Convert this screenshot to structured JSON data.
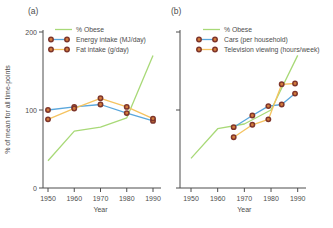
{
  "chart_data": [
    {
      "type": "line",
      "panel_label": "(a)",
      "xlabel": "Year",
      "ylabel": "% of mean for all time-points",
      "xlim": [
        1948,
        1993
      ],
      "ylim": [
        0,
        200
      ],
      "x_ticks": [
        1950,
        1960,
        1970,
        1980,
        1990
      ],
      "y_ticks": [
        0,
        100,
        200
      ],
      "show_y_tick_labels": true,
      "grid": false,
      "legend_position": "top-inside",
      "marker_style": {
        "fill": "#d47c3c",
        "stroke": "#7e352b"
      },
      "series": [
        {
          "name": "% Obese",
          "color": "#a8d977",
          "markers": false,
          "x": [
            1950,
            1960,
            1970,
            1980,
            1990
          ],
          "values": [
            35,
            73,
            78,
            90,
            170
          ]
        },
        {
          "name": "Energy intake (MJ/day)",
          "color": "#5aa7dc",
          "markers": true,
          "x": [
            1950,
            1960,
            1970,
            1980,
            1990
          ],
          "values": [
            100,
            104,
            107,
            96,
            86
          ]
        },
        {
          "name": "Fat intake (g/day)",
          "color": "#f5c360",
          "markers": true,
          "x": [
            1950,
            1960,
            1970,
            1980,
            1990
          ],
          "values": [
            88,
            102,
            115,
            104,
            89
          ]
        }
      ]
    },
    {
      "type": "line",
      "panel_label": "(b)",
      "xlabel": "Year",
      "ylabel": "",
      "xlim": [
        1948,
        1993
      ],
      "ylim": [
        0,
        200
      ],
      "x_ticks": [
        1950,
        1960,
        1970,
        1980,
        1990
      ],
      "y_ticks": [
        0,
        100,
        200
      ],
      "show_y_tick_labels": false,
      "grid": false,
      "legend_position": "top-inside",
      "marker_style": {
        "fill": "#d47c3c",
        "stroke": "#7e352b"
      },
      "series": [
        {
          "name": "% Obese",
          "color": "#a8d977",
          "markers": false,
          "x": [
            1950,
            1960,
            1970,
            1980,
            1990
          ],
          "values": [
            38,
            76,
            82,
            100,
            170
          ]
        },
        {
          "name": "Cars (per household)",
          "color": "#5aa7dc",
          "markers": true,
          "x": [
            1966,
            1973,
            1979,
            1984,
            1989
          ],
          "values": [
            78,
            93,
            105,
            107,
            121
          ]
        },
        {
          "name": "Television viewing (hours/week)",
          "color": "#f5c360",
          "markers": true,
          "x": [
            1966,
            1973,
            1979,
            1984,
            1989
          ],
          "values": [
            65,
            81,
            88,
            133,
            134
          ]
        }
      ]
    }
  ],
  "style": {
    "axis_color": "#4d4d4d",
    "text_color": "#4d4d4d",
    "background": "#ffffff"
  }
}
